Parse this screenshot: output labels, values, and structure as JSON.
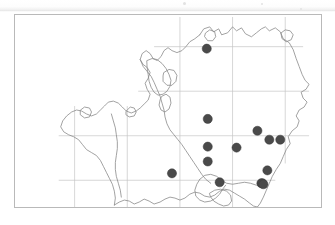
{
  "figure": {
    "kind": "species-distribution-map",
    "region_name": "vice-county outline",
    "frame": {
      "x": 14,
      "y": 14,
      "width": 308,
      "height": 194
    },
    "background_color": "#ffffff",
    "frame_color": "#b9b9b9"
  },
  "chart_data": {
    "type": "scatter",
    "title": "",
    "subtitle": "",
    "xlabel": "",
    "ylabel": "",
    "grid": true,
    "legend": null,
    "projection": "national-grid",
    "xlim": [
      0,
      308
    ],
    "ylim": [
      0,
      194
    ],
    "marker": {
      "shape": "circle",
      "fill": "#4a4a4a",
      "stroke": "#3a3a3a",
      "radius_px": 4.6
    },
    "point_count": 14,
    "points": [
      {
        "id": "rec-01",
        "x": 193,
        "y": 34
      },
      {
        "id": "rec-02",
        "x": 194,
        "y": 105
      },
      {
        "id": "rec-03",
        "x": 244,
        "y": 117
      },
      {
        "id": "rec-04",
        "x": 256,
        "y": 126
      },
      {
        "id": "rec-05",
        "x": 267,
        "y": 126
      },
      {
        "id": "rec-06",
        "x": 194,
        "y": 133
      },
      {
        "id": "rec-07",
        "x": 223,
        "y": 134
      },
      {
        "id": "rec-08",
        "x": 194,
        "y": 148
      },
      {
        "id": "rec-09",
        "x": 158,
        "y": 160
      },
      {
        "id": "rec-10",
        "x": 254,
        "y": 157
      },
      {
        "id": "rec-11",
        "x": 206,
        "y": 169
      },
      {
        "id": "rec-12",
        "x": 248,
        "y": 170
      },
      {
        "id": "rec-13",
        "x": 249,
        "y": 170
      },
      {
        "id": "rec-14",
        "x": 250,
        "y": 171
      }
    ],
    "grid_lines": {
      "color": "#c5c5c5",
      "width_px": 0.7,
      "vertical_x": [
        60,
        113,
        166,
        219,
        272
      ],
      "horizontal_y": [
        32,
        77,
        122,
        167
      ]
    }
  },
  "caption": {
    "text": ""
  }
}
